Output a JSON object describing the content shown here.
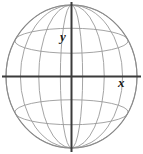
{
  "figure": {
    "background_color": "#ffffff",
    "width": 143,
    "height": 154
  },
  "sphere": {
    "outline_color": "#8a8a8a",
    "grid_color": "#9a9a9a",
    "outline_width": 1.1,
    "grid_width": 0.9,
    "center_x": 71.5,
    "center_y": 76.5,
    "radius_x": 65.5,
    "radius_y": 71.5,
    "meridian_count": 8,
    "latitude_count": 2,
    "meridian_offsets": [
      -1.0,
      -0.78,
      -0.5,
      -0.17,
      0.17,
      0.5,
      0.78,
      1.0
    ],
    "latitude_offsets": [
      -0.5,
      0.5
    ]
  },
  "axes": {
    "color": "#3b3b3b",
    "width": 2.0,
    "x_axis": {
      "label": "x",
      "y_position": 76.5,
      "x_start": 2,
      "x_end": 141
    },
    "y_axis": {
      "label": "y",
      "x_position": 71.5,
      "y_start": 2,
      "y_end": 152
    }
  },
  "labels": {
    "y_label": "y",
    "x_label": "x"
  }
}
